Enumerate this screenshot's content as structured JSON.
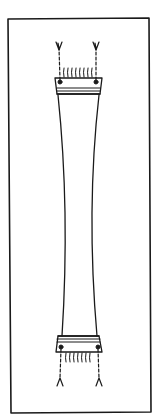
{
  "figure": {
    "stroke_color": "#1a1a1a",
    "background_color": "#ffffff"
  },
  "parts": {
    "frame": "outer rectangular border",
    "specimen": "waisted strip with concave sides",
    "top_tab": "upper end tab with three horizontal bands",
    "bottom_tab": "lower end tab with three horizontal bands",
    "top_fibers": "row of fiber ends above top tab",
    "bottom_fibers": "row of fiber ends below bottom tab",
    "tethers": "four beaded cords with frayed ends attached at tab corners"
  }
}
